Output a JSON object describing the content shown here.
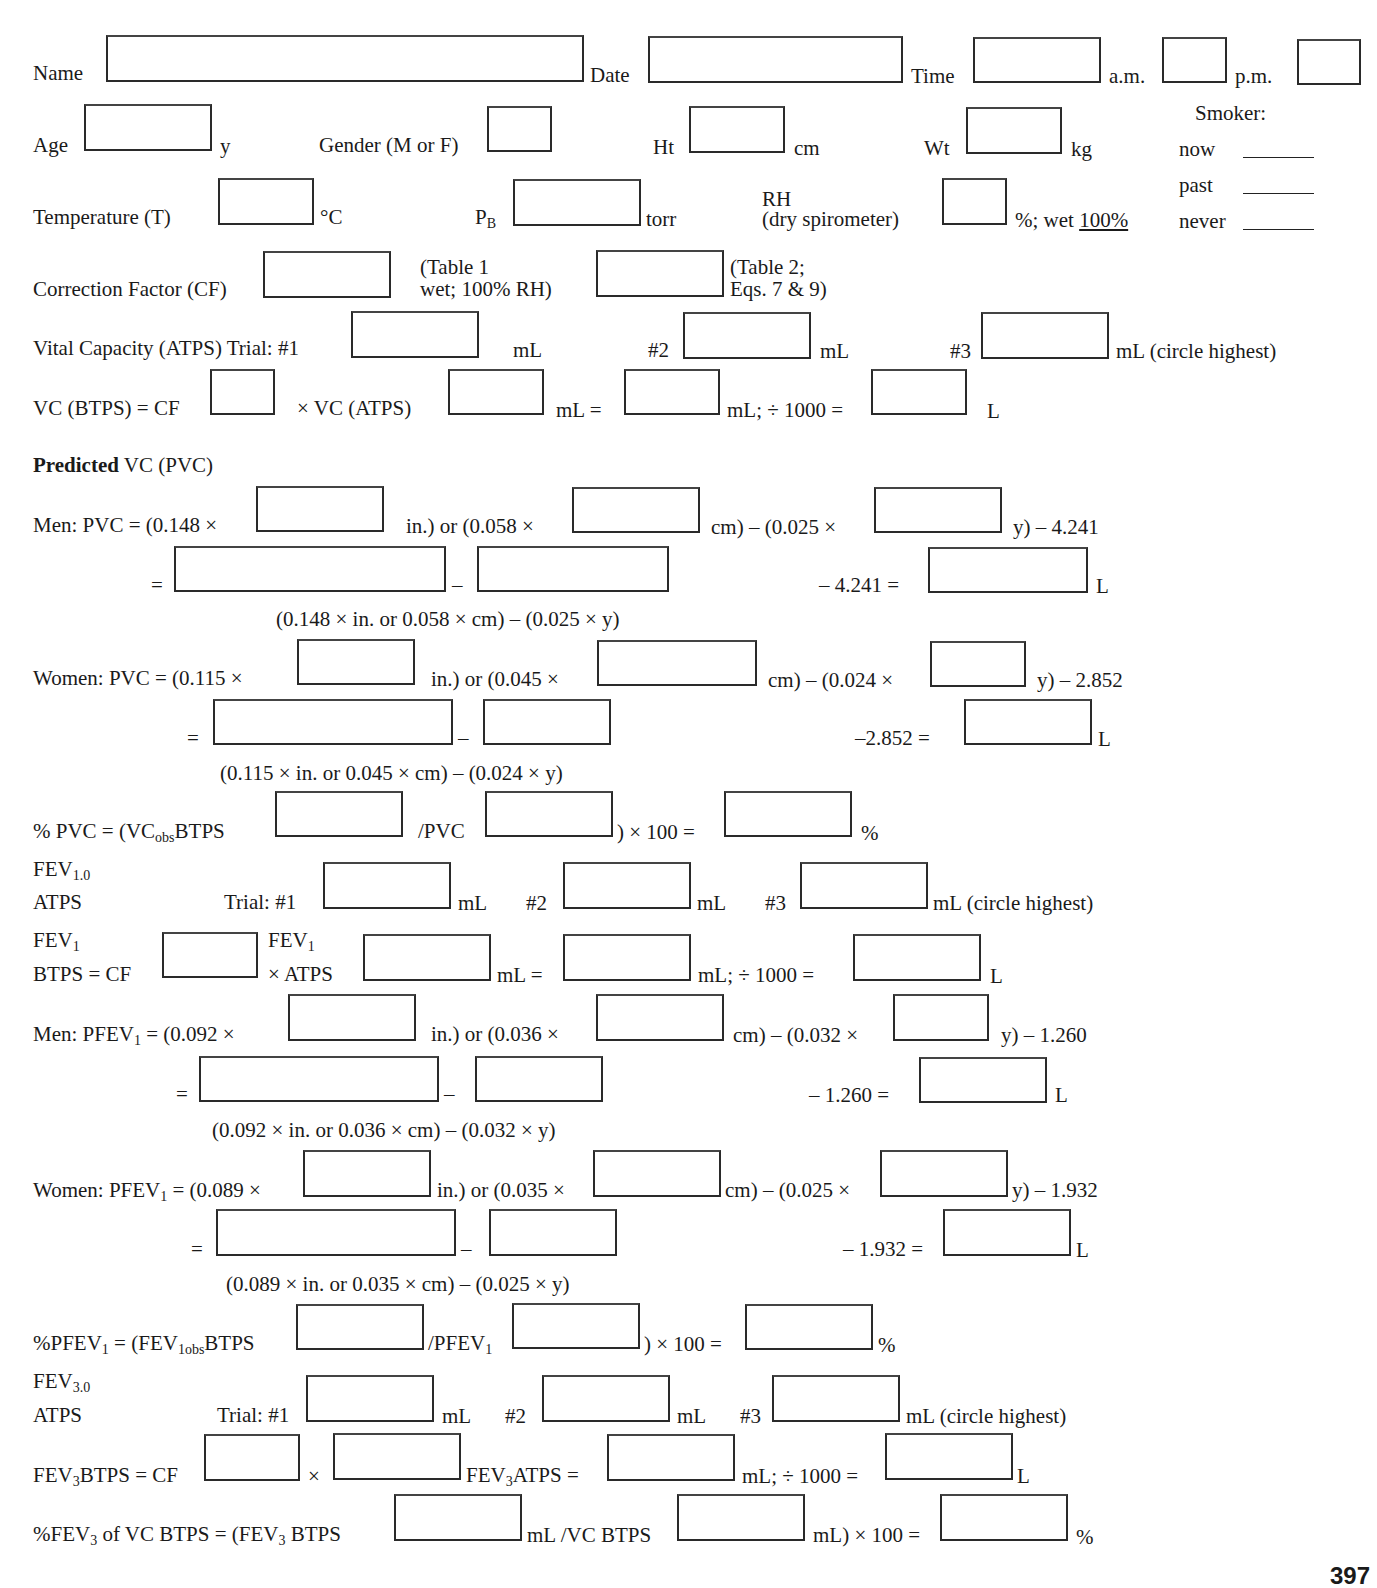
{
  "header": {
    "name_label": "Name",
    "date_label": "Date",
    "time_label": "Time",
    "am_label": "a.m.",
    "pm_label": "p.m.",
    "age_label": "Age",
    "age_unit": "y",
    "gender_label": "Gender (M or F)",
    "ht_label": "Ht",
    "ht_unit": "cm",
    "wt_label": "Wt",
    "wt_unit": "kg",
    "temp_label": "Temperature (T)",
    "temp_unit": "°C",
    "pb_label": "P",
    "pb_sub": "B",
    "pb_unit": "torr",
    "rh_label": "RH",
    "rh_sub_label": "(dry spirometer)",
    "rh_unit": "%; wet ",
    "rh_wet_value": "100%"
  },
  "smoker": {
    "title": "Smoker:",
    "options": [
      "now",
      "past",
      "never"
    ]
  },
  "cf": {
    "label": "Correction Factor (CF)",
    "note1_line1": "(Table 1",
    "note1_line2": "wet; 100% RH)",
    "note2_line1": "(Table 2;",
    "note2_line2": "Eqs. 7 & 9)"
  },
  "vc": {
    "label": "Vital Capacity (ATPS) Trial: #1",
    "unit": "mL",
    "t2": "#2",
    "t3": "#3",
    "circle": "mL (circle highest)",
    "btps_label": "VC (BTPS) = CF",
    "x_vc_atps": "× VC (ATPS)",
    "ml_eq": "mL =",
    "ml_div": "mL; ÷ 1000 =",
    "l": "L"
  },
  "pvc": {
    "title_bold": "Predicted",
    "title_rest": " VC (PVC)",
    "men": {
      "lead": "Men: PVC = (0.148 ×",
      "in_or": "in.) or (0.058 ×",
      "cm": "cm) – (0.025 ×",
      "y": "y) – 4.241",
      "eq": "=",
      "minus": "–",
      "const_eq": "– 4.241 =",
      "l": "L",
      "caption": "(0.148 × in. or 0.058 × cm) – (0.025 × y)"
    },
    "women": {
      "lead": "Women: PVC = (0.115 ×",
      "in_or": "in.) or (0.045 ×",
      "cm": "cm) – (0.024 ×",
      "y": "y) – 2.852",
      "eq": "=",
      "minus": "–",
      "const_eq": "–2.852 =",
      "l": "L",
      "caption": "(0.115 × in. or 0.045 × cm) – (0.024 × y)"
    },
    "pct_lead": "% PVC = (VC",
    "pct_sub": "obs",
    "pct_btps": "BTPS",
    "pct_div": "/PVC",
    "pct_x100": ") × 100 =",
    "pct_unit": "%"
  },
  "fev1": {
    "title": "FEV",
    "title_sub": "1.0",
    "atps": "ATPS",
    "trial": "Trial: #1",
    "ml": "mL",
    "t2": "#2",
    "t3": "#3",
    "circle": "mL (circle highest)",
    "btps_top": "FEV",
    "btps_top_sub": "1",
    "btps_bottom": "BTPS = CF",
    "atps_top": "FEV",
    "atps_top_sub": "1",
    "atps_bottom": "× ATPS",
    "ml_eq": "mL =",
    "ml_div": "mL; ÷ 1000 =",
    "l": "L"
  },
  "pfev1": {
    "men": {
      "lead": "Men: PFEV",
      "lead_sub": "1",
      "lead_rest": " = (0.092 ×",
      "in_or": "in.) or (0.036 ×",
      "cm": "cm) – (0.032 ×",
      "y": "y) – 1.260",
      "eq": "=",
      "minus": "–",
      "const_eq": "– 1.260 =",
      "l": "L",
      "caption": "(0.092 × in. or 0.036 × cm) – (0.032 × y)"
    },
    "women": {
      "lead": "Women: PFEV",
      "lead_sub": "1",
      "lead_rest": " = (0.089 ×",
      "in_or": "in.) or (0.035 ×",
      "cm": "cm) – (0.025 ×",
      "y": "y) – 1.932",
      "eq": "=",
      "minus": "–",
      "const_eq": "– 1.932 =",
      "l": "L",
      "caption": "(0.089 × in. or 0.035 × cm) – (0.025 × y)"
    },
    "pct_lead": "%PFEV",
    "pct_lead_sub": "1",
    "pct_mid": " = (FEV",
    "pct_mid_sub": "1obs",
    "pct_btps": "BTPS",
    "pct_div": "/PFEV",
    "pct_div_sub": "1",
    "pct_x100": ") × 100 =",
    "pct_unit": "%"
  },
  "fev3": {
    "title": "FEV",
    "title_sub": "3.0",
    "atps": "ATPS",
    "trial": "Trial: #1",
    "ml": "mL",
    "t2": "#2",
    "t3": "#3",
    "circle": "mL (circle highest)",
    "btps_lead": "FEV",
    "btps_lead_sub": "3",
    "btps_rest": "BTPS = CF",
    "times": "×",
    "atps_mid": "FEV",
    "atps_mid_sub": "3",
    "atps_mid_rest": "ATPS =",
    "ml_div": "mL; ÷ 1000 =",
    "l": "L",
    "pct_lead": "%FEV",
    "pct_lead_sub": "3",
    "pct_lead_rest": " of VC BTPS = (FEV",
    "pct_lead_sub2": "3",
    "pct_lead_rest2": " BTPS",
    "pct_ml_vc": "mL /VC BTPS",
    "pct_x100": "mL) × 100 =",
    "pct_unit": "%"
  },
  "page_number": "397"
}
